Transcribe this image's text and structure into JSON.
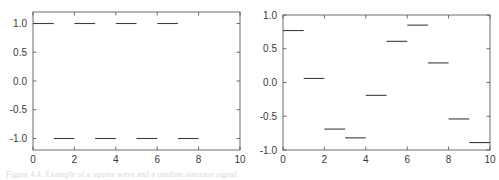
{
  "figure": {
    "caption": "Figure 4.4:  Example of a square wave and a random staircase signal."
  },
  "chart_data": [
    {
      "type": "line",
      "name": "square-wave-plot",
      "title": "",
      "xlabel": "",
      "ylabel": "",
      "xlim": [
        0,
        10
      ],
      "ylim": [
        -1.2,
        1.2
      ],
      "xticks": [
        0,
        2,
        4,
        6,
        8,
        10
      ],
      "xticklabels": [
        "0",
        "2",
        "4",
        "6",
        "8",
        "10"
      ],
      "yticks": [
        -1.0,
        -0.5,
        0.0,
        0.5,
        1.0
      ],
      "yticklabels": [
        "-1.0",
        "-0.5",
        "0.0",
        "0.5",
        "1.0"
      ],
      "grid": false,
      "legend": null,
      "style": "piecewise-constant-segments",
      "segments": [
        {
          "x0": 0,
          "x1": 1,
          "y": 1.0
        },
        {
          "x0": 1,
          "x1": 2,
          "y": -1.0
        },
        {
          "x0": 2,
          "x1": 3,
          "y": 1.0
        },
        {
          "x0": 3,
          "x1": 4,
          "y": -1.0
        },
        {
          "x0": 4,
          "x1": 5,
          "y": 1.0
        },
        {
          "x0": 5,
          "x1": 6,
          "y": -1.0
        },
        {
          "x0": 6,
          "x1": 7,
          "y": 1.0
        },
        {
          "x0": 7,
          "x1": 8,
          "y": -1.0
        }
      ]
    },
    {
      "type": "line",
      "name": "random-staircase-plot",
      "title": "",
      "xlabel": "",
      "ylabel": "",
      "xlim": [
        0,
        10
      ],
      "ylim": [
        -1.0,
        1.0
      ],
      "xticks": [
        0,
        2,
        4,
        6,
        8,
        10
      ],
      "xticklabels": [
        "0",
        "2",
        "4",
        "6",
        "8",
        "10"
      ],
      "yticks": [
        -1.0,
        -0.5,
        0.0,
        0.5,
        1.0
      ],
      "yticklabels": [
        "-1.0",
        "-0.5",
        "0.0",
        "0.5",
        "1.0"
      ],
      "grid": false,
      "legend": null,
      "style": "piecewise-constant-segments",
      "segments": [
        {
          "x0": 0,
          "x1": 1,
          "y": 0.77
        },
        {
          "x0": 1,
          "x1": 2,
          "y": 0.06
        },
        {
          "x0": 2,
          "x1": 3,
          "y": -0.69
        },
        {
          "x0": 3,
          "x1": 4,
          "y": -0.82
        },
        {
          "x0": 4,
          "x1": 5,
          "y": -0.19
        },
        {
          "x0": 5,
          "x1": 6,
          "y": 0.61
        },
        {
          "x0": 6,
          "x1": 7,
          "y": 0.85
        },
        {
          "x0": 7,
          "x1": 8,
          "y": 0.29
        },
        {
          "x0": 8,
          "x1": 9,
          "y": -0.54
        },
        {
          "x0": 9,
          "x1": 10,
          "y": -0.89
        }
      ]
    }
  ]
}
